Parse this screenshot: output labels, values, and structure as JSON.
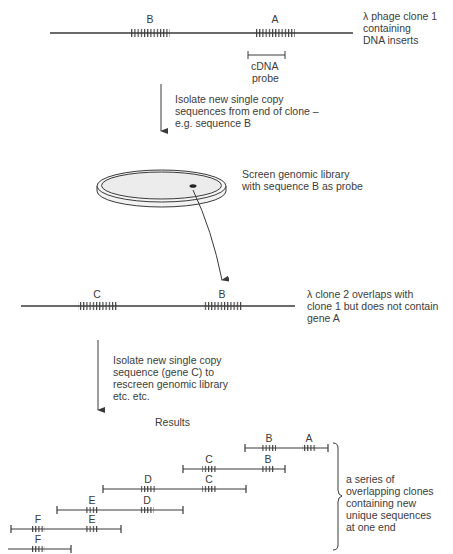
{
  "clone1": {
    "caption": [
      "λ phage clone 1",
      "containing",
      "DNA inserts"
    ],
    "gene_labels": [
      "B",
      "A"
    ],
    "probe_label": [
      "cDNA",
      "probe"
    ]
  },
  "step1": {
    "text": [
      "Isolate new single copy",
      "sequences from end of clone –",
      "e.g. sequence B"
    ]
  },
  "screen": {
    "text": [
      "Screen genomic library",
      "with sequence B as probe"
    ]
  },
  "clone2": {
    "caption": [
      "λ clone 2 overlaps with",
      "clone 1 but does not contain",
      "gene A"
    ],
    "gene_labels": [
      "C",
      "B"
    ]
  },
  "step2": {
    "text": [
      "Isolate new single copy",
      "sequence (gene C) to",
      "rescreen genomic library",
      "etc. etc."
    ]
  },
  "results": {
    "title": "Results",
    "rows": [
      {
        "x1": 245,
        "x2": 328,
        "y": 448,
        "genes": [
          {
            "label": "B",
            "x": 269
          },
          {
            "label": "A",
            "x": 309
          }
        ]
      },
      {
        "x1": 183,
        "x2": 285,
        "y": 469,
        "genes": [
          {
            "label": "C",
            "x": 209
          },
          {
            "label": "B",
            "x": 268
          }
        ]
      },
      {
        "x1": 103,
        "x2": 246,
        "y": 489,
        "genes": [
          {
            "label": "D",
            "x": 148
          },
          {
            "label": "C",
            "x": 209
          }
        ]
      },
      {
        "x1": 57,
        "x2": 183,
        "y": 510,
        "genes": [
          {
            "label": "E",
            "x": 92
          },
          {
            "label": "D",
            "x": 147
          }
        ]
      },
      {
        "x1": 11,
        "x2": 121,
        "y": 529,
        "genes": [
          {
            "label": "F",
            "x": 38
          },
          {
            "label": "E",
            "x": 92
          }
        ]
      },
      {
        "x1": 8,
        "x2": 71,
        "y": 549,
        "genes": [
          {
            "label": "F",
            "x": 38
          }
        ],
        "open_left": true
      }
    ],
    "bracket_caption": [
      "a series of",
      "overlapping clones",
      "containing new",
      "unique sequences",
      "at one end"
    ]
  }
}
